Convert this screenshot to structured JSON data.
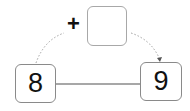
{
  "diagram": {
    "type": "number-line-jump",
    "start": {
      "label": "8"
    },
    "end": {
      "label": "9"
    },
    "operator": {
      "symbol": "+"
    },
    "answer_box": {
      "value": ""
    },
    "colors": {
      "box_border": "#8a8a8a",
      "connector_line": "#8a8a8a",
      "dotted_arc": "#9a9a9a",
      "text": "#111111"
    }
  }
}
